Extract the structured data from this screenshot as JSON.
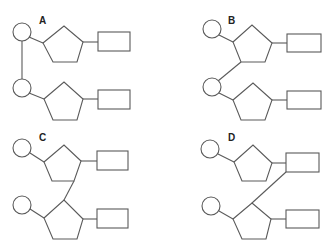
{
  "panels": [
    {
      "label": "A",
      "linkage": "circle-to-circle"
    },
    {
      "label": "B",
      "linkage": "pentagon-to-circle"
    },
    {
      "label": "C",
      "linkage": "pentagon-to-pentagon"
    },
    {
      "label": "D",
      "linkage": "rectangle-to-pentagon"
    }
  ],
  "colors": {
    "stroke": "#5a5a5a",
    "fill": "#ffffff",
    "label": "#222222"
  }
}
